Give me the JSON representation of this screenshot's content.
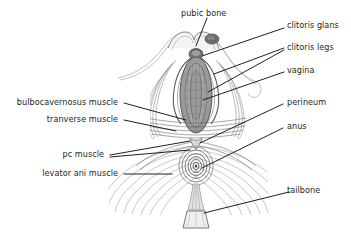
{
  "figure": {
    "background_color": "#ffffff",
    "line_color": "#231f20",
    "ink_dark": "#4a4a4a",
    "ink_mid": "#8a8a8a",
    "ink_light": "#bdbdbd",
    "fill_light": "#e9e9e9"
  },
  "labels": {
    "pubic_bone": "pubic bone",
    "clitoris_glans": "clitoris glans",
    "clitoris_legs": "clitoris legs",
    "vagina": "vagina",
    "perineum": "perineum",
    "anus": "anus",
    "tailbone": "tailbone",
    "bulbocavernosus_muscle": "bulbocavernosus muscle",
    "tranverse_muscle": "tranverse muscle",
    "pc_muscle": "pc muscle",
    "levator_ani_muscle": "levator ani muscle"
  }
}
